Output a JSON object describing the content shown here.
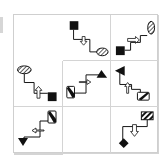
{
  "puzzle": {
    "type": "3x3 matrix",
    "cells": [
      {
        "row": 1,
        "col": 1,
        "start": "black-square",
        "arrow": "down",
        "end": "hatched-ellipse"
      },
      {
        "row": 1,
        "col": 2,
        "start": "black-square",
        "arrow": "right",
        "end": "hatched-ellipse-vertical"
      },
      {
        "row": 1,
        "col": 3,
        "start": "hatched-ellipse",
        "arrow": "up",
        "end": "black-square"
      },
      {
        "row": 2,
        "col": 1,
        "start": "diagonal-rect",
        "arrow": "right",
        "end": "black-triangle-up"
      },
      {
        "row": 2,
        "col": 2,
        "start": "diagonal-rect",
        "arrow": "up",
        "end": "black-triangle-left"
      },
      {
        "row": 2,
        "col": 3,
        "start": "diagonal-rect",
        "arrow": "left",
        "end": "black-triangle-down"
      },
      {
        "row": 3,
        "col": 1,
        "missing": true
      },
      {
        "row": 3,
        "col": 2,
        "start": "striped-rect",
        "arrow": "down",
        "end": "black-diamond"
      },
      {
        "row": 3,
        "col": 3,
        "start": "striped-rect",
        "arrow": "right",
        "end": "black-diamond"
      }
    ]
  },
  "colors": {
    "ink": "#111111",
    "grid": "#d0d0d0",
    "background": "#ffffff"
  }
}
